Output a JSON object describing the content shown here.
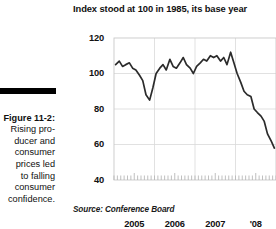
{
  "figure": {
    "label": "Figure 11-2:",
    "caption": "Rising producer and consumer prices led to falling consumer confidence.",
    "caption_lines": "Rising pro-\nducer and\nconsumer\nprices led\nto falling\nconsumer\nconfidence."
  },
  "source": {
    "text": "Source: Conference Board"
  },
  "chart_data": {
    "type": "line",
    "title": "Index stood at 100 in 1985, its base year",
    "xlabel": "",
    "ylabel": "",
    "ylim": [
      40,
      120
    ],
    "yticks": [
      40,
      60,
      80,
      100,
      120
    ],
    "ytick_labels": [
      "40",
      "60",
      "80",
      "100",
      "120"
    ],
    "xtick_labels": [
      "2005",
      "2006",
      "2007",
      "'08"
    ],
    "xtick_positions": [
      2005.0,
      2006.0,
      2007.0,
      2008.0
    ],
    "xlim": [
      2004.5,
      2008.5
    ],
    "grid": true,
    "grid_horizontal": [
      60,
      80,
      100
    ],
    "grid_vertical": [
      2005.5,
      2006.5,
      2007.5
    ],
    "legend": "none",
    "line_color": "#2b2b2b",
    "series": [
      {
        "name": "Consumer Confidence Index",
        "x": [
          2004.54,
          2004.63,
          2004.71,
          2004.79,
          2004.88,
          2004.96,
          2005.04,
          2005.13,
          2005.21,
          2005.29,
          2005.38,
          2005.46,
          2005.54,
          2005.63,
          2005.71,
          2005.79,
          2005.88,
          2005.96,
          2006.04,
          2006.13,
          2006.21,
          2006.29,
          2006.38,
          2006.46,
          2006.54,
          2006.63,
          2006.71,
          2006.79,
          2006.88,
          2006.96,
          2007.04,
          2007.13,
          2007.21,
          2007.29,
          2007.38,
          2007.46,
          2007.54,
          2007.63,
          2007.71,
          2007.79,
          2007.88,
          2007.96,
          2008.04,
          2008.13,
          2008.21,
          2008.29,
          2008.38,
          2008.46
        ],
        "values": [
          105,
          107,
          104,
          105,
          106,
          103,
          102,
          99,
          96,
          88,
          85,
          92,
          100,
          103,
          105,
          102,
          108,
          104,
          103,
          106,
          109,
          105,
          103,
          100,
          104,
          106,
          108,
          107,
          110,
          109,
          110,
          107,
          109,
          105,
          112,
          106,
          100,
          95,
          90,
          88,
          87,
          80,
          78,
          76,
          73,
          66,
          62,
          58
        ]
      }
    ]
  }
}
